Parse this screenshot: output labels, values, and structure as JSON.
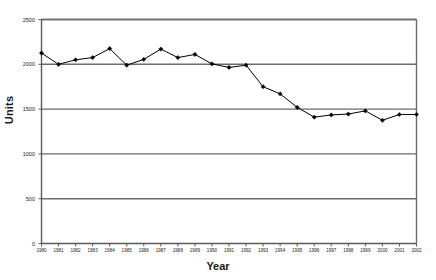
{
  "chart_data": {
    "type": "line",
    "title": "",
    "xlabel": "Year",
    "ylabel": "Units",
    "categories": [
      1980,
      1981,
      1982,
      1983,
      1984,
      1985,
      1986,
      1987,
      1988,
      1989,
      1990,
      1991,
      1992,
      1993,
      1994,
      1995,
      1996,
      1997,
      1998,
      1999,
      2000,
      2001,
      2002
    ],
    "x_tick_labels": [
      "1980",
      "1981",
      "1982",
      "1983",
      "1984",
      "1985",
      "1986",
      "1987",
      "1988",
      "1989",
      "1990",
      "1991",
      "1992",
      "1993",
      "1994",
      "1995",
      "1996",
      "1997",
      "1998",
      "1999",
      "2000",
      "2001",
      "2002"
    ],
    "values": [
      2125,
      2000,
      2050,
      2075,
      2175,
      1990,
      2055,
      2170,
      2075,
      2110,
      2005,
      1965,
      1990,
      1750,
      1670,
      1520,
      1410,
      1435,
      1445,
      1480,
      1375,
      1440,
      1440
    ],
    "series": [
      {
        "name": "Units",
        "values": [
          2125,
          2000,
          2050,
          2075,
          2175,
          1990,
          2055,
          2170,
          2075,
          2110,
          2005,
          1965,
          1990,
          1750,
          1670,
          1520,
          1410,
          1435,
          1445,
          1480,
          1375,
          1440,
          1440
        ]
      }
    ],
    "ylim": [
      0,
      2500
    ],
    "y_ticks": [
      0,
      500,
      1000,
      1500,
      2000,
      2500
    ],
    "y_tick_labels": [
      "0",
      "500",
      "1000",
      "1500",
      "2000",
      "2500"
    ],
    "xlim": [
      1980,
      2002
    ],
    "grid": "horizontal",
    "legend": "none",
    "marker": "filled-diamond",
    "line_color": "#000000",
    "grid_color": "#6b6b6b",
    "axis_color": "#5a5a5a",
    "background_color": "#ffffff",
    "plot_background_color": "#ffffff"
  }
}
